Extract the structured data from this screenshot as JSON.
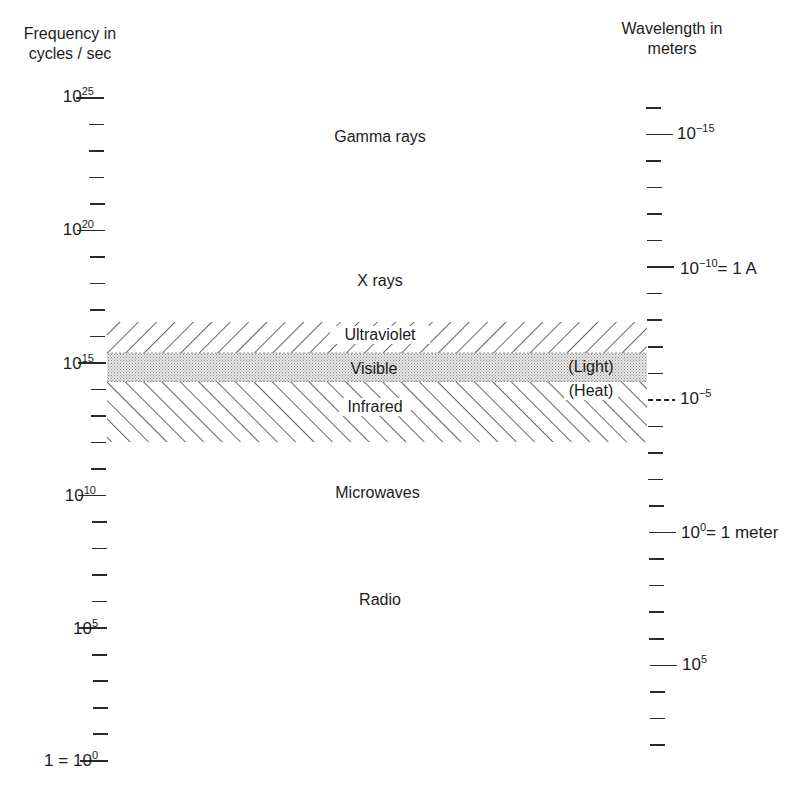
{
  "left_axis": {
    "title_line1": "Frequency in",
    "title_line2": "cycles / sec",
    "major_ticks": [
      {
        "base": "10",
        "exp": "25",
        "prefix": "",
        "y": 97
      },
      {
        "base": "10",
        "exp": "20",
        "prefix": "",
        "y": 230
      },
      {
        "base": "10",
        "exp": "15",
        "prefix": "",
        "y": 364
      },
      {
        "base": "10",
        "exp": "10",
        "prefix": "",
        "y": 495
      },
      {
        "base": "10",
        "exp": "5",
        "prefix": "",
        "y": 628
      },
      {
        "base": "10",
        "exp": "0",
        "prefix": "1 = ",
        "y": 760
      }
    ]
  },
  "right_axis": {
    "title_line1": "Wavelength in",
    "title_line2": "meters",
    "major_ticks": [
      {
        "base": "10",
        "exp": "−15",
        "suffix": "",
        "y": 133
      },
      {
        "base": "10",
        "exp": "−10",
        "suffix": "= 1 A",
        "y": 268
      },
      {
        "base": "10",
        "exp": "−5",
        "suffix": "",
        "y": 398
      },
      {
        "base": "10",
        "exp": "0",
        "suffix": "= 1 meter",
        "y": 532
      },
      {
        "base": "10",
        "exp": "5",
        "suffix": "",
        "y": 664
      }
    ]
  },
  "regions": {
    "gamma": "Gamma rays",
    "xray": "X rays",
    "ultraviolet": "Ultraviolet",
    "visible": "Visible",
    "infrared": "Infrared",
    "microwaves": "Microwaves",
    "radio": "Radio",
    "light_note": "(Light)",
    "heat_note": "(Heat)"
  },
  "chart_data": {
    "type": "table",
    "left_axis": {
      "label": "Frequency in cycles/sec",
      "scale": "log",
      "ticks": [
        "1 = 10^0",
        "10^5",
        "10^10",
        "10^15",
        "10^20",
        "10^25"
      ],
      "range": [
        0,
        25
      ]
    },
    "right_axis": {
      "label": "Wavelength in meters",
      "scale": "log",
      "ticks": [
        "10^-15",
        "10^-10 = 1 A",
        "10^-5",
        "10^0 = 1 meter",
        "10^5"
      ]
    },
    "regions": [
      {
        "name": "Gamma rays",
        "approx_log10_freq": 23
      },
      {
        "name": "X rays",
        "approx_log10_freq": 18.5
      },
      {
        "name": "Ultraviolet",
        "approx_log10_freq_range": [
          15.3,
          16.5
        ],
        "note": "hatched"
      },
      {
        "name": "Visible",
        "approx_log10_freq_range": [
          14.4,
          15.4
        ],
        "note": "(Light), stippled"
      },
      {
        "name": "Infrared",
        "approx_log10_freq_range": [
          12,
          14.4
        ],
        "note": "(Heat), hatched"
      },
      {
        "name": "Microwaves",
        "approx_log10_freq": 10
      },
      {
        "name": "Radio",
        "approx_log10_freq": 6
      }
    ]
  }
}
